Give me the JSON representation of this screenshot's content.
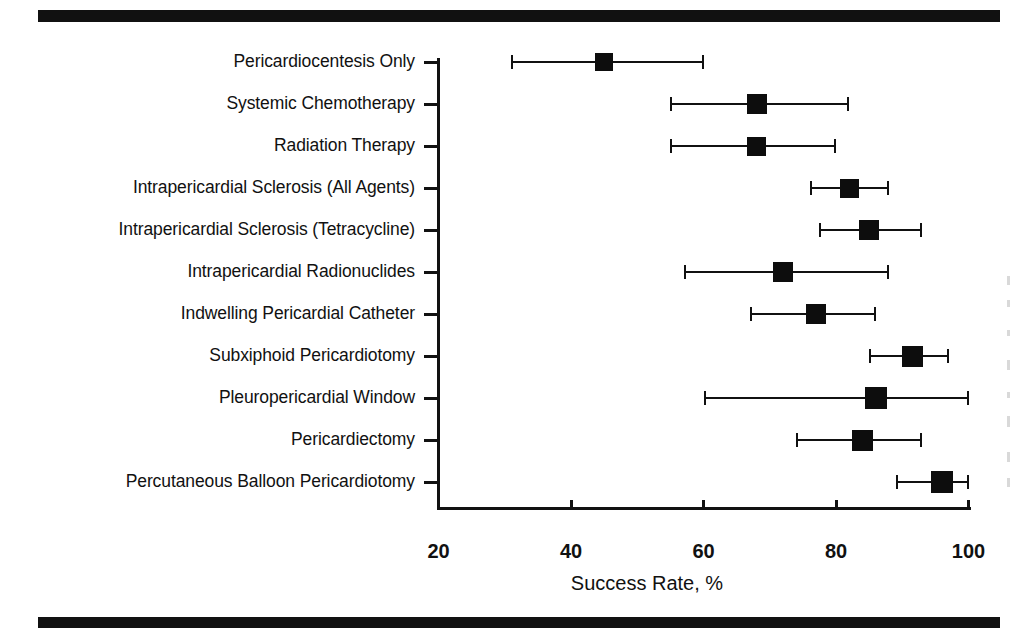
{
  "figure": {
    "type": "forest-plot",
    "xaxis_title": "Success Rate, %"
  },
  "chart_data": {
    "type": "scatter",
    "title": "",
    "subtitle": "",
    "xlabel": "Success Rate, %",
    "ylabel": "",
    "xlim": [
      20,
      100
    ],
    "xticks": [
      20,
      40,
      60,
      80,
      100
    ],
    "xtick_labels": [
      "20",
      "40",
      "60",
      "80",
      "100"
    ],
    "grid": false,
    "legend": null,
    "orientation": "horizontal",
    "marker": "filled-square",
    "error_bars": "horizontal 95% CI with end caps",
    "categories": [
      "Pericardiocentesis Only",
      "Systemic Chemotherapy",
      "Radiation Therapy",
      "Intrapericardial Sclerosis (All Agents)",
      "Intrapericardial Sclerosis (Tetracycline)",
      "Intrapericardial Radionuclides",
      "Indwelling Pericardial Catheter",
      "Subxiphoid Pericardiotomy",
      "Pleuropericardial Window",
      "Pericardiectomy",
      "Percutaneous Balloon Pericardiotomy"
    ],
    "values": [
      45,
      68,
      68,
      82,
      85,
      72,
      77,
      91.5,
      86,
      84,
      96
    ],
    "ci_low": [
      31,
      55,
      55,
      76,
      77.5,
      57,
      67,
      85,
      60,
      74,
      89
    ],
    "ci_high": [
      60,
      82,
      80,
      88,
      93,
      88,
      86,
      97,
      100,
      93,
      100
    ],
    "points": [
      {
        "label": "Pericardiocentesis Only",
        "value": 45,
        "low": 31,
        "high": 60,
        "marker_size": 18
      },
      {
        "label": "Systemic Chemotherapy",
        "value": 68,
        "low": 55,
        "high": 82,
        "marker_size": 20
      },
      {
        "label": "Radiation Therapy",
        "value": 68,
        "low": 55,
        "high": 80,
        "marker_size": 19
      },
      {
        "label": "Intrapericardial Sclerosis (All Agents)",
        "value": 82,
        "low": 76,
        "high": 88,
        "marker_size": 19
      },
      {
        "label": "Intrapericardial Sclerosis (Tetracycline)",
        "value": 85,
        "low": 77.5,
        "high": 93,
        "marker_size": 20
      },
      {
        "label": "Intrapericardial Radionuclides",
        "value": 72,
        "low": 57,
        "high": 88,
        "marker_size": 20
      },
      {
        "label": "Indwelling Pericardial Catheter",
        "value": 77,
        "low": 67,
        "high": 86,
        "marker_size": 20
      },
      {
        "label": "Subxiphoid Pericardiotomy",
        "value": 91.5,
        "low": 85,
        "high": 97,
        "marker_size": 21
      },
      {
        "label": "Pleuropericardial Window",
        "value": 86,
        "low": 60,
        "high": 100,
        "marker_size": 22
      },
      {
        "label": "Pericardiectomy",
        "value": 84,
        "low": 74,
        "high": 93,
        "marker_size": 21
      },
      {
        "label": "Percutaneous Balloon Pericardiotomy",
        "value": 96,
        "low": 89,
        "high": 100,
        "marker_size": 22
      }
    ],
    "colors": {
      "marker": "#0d0d0d",
      "axis": "#111111",
      "background": "#ffffff",
      "rule": "#111111"
    }
  }
}
